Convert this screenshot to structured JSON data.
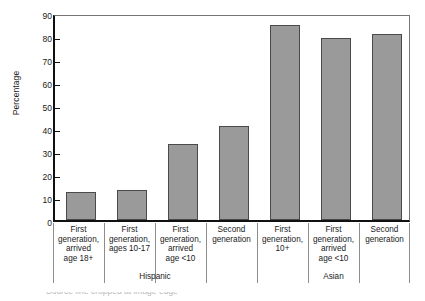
{
  "chart_data": {
    "type": "bar",
    "title": "",
    "xlabel": "",
    "ylabel": "Percentage",
    "ylim": [
      0,
      90
    ],
    "ytick_step": 10,
    "yticks": [
      0,
      10,
      20,
      30,
      40,
      50,
      60,
      70,
      80,
      90
    ],
    "grid": false,
    "legend": "none",
    "bar_color": "#9a9a9a",
    "bar_edge_color": "#4a4a4a",
    "categories": [
      "First generation, arrived age 18+",
      "First generation, ages 10-17",
      "First generation, arrived age <10",
      "Second generation",
      "First generation, 10+",
      "First generation, arrived age <10",
      "Second generation"
    ],
    "category_lines": [
      [
        "First",
        "generation,",
        "arrived",
        "age 18+"
      ],
      [
        "First",
        "generation,",
        "ages 10-17"
      ],
      [
        "First",
        "generation,",
        "arrived",
        "age <10"
      ],
      [
        "Second",
        "generation"
      ],
      [
        "First",
        "generation,",
        "10+"
      ],
      [
        "First",
        "generation,",
        "arrived",
        "age <10"
      ],
      [
        "Second",
        "generation"
      ]
    ],
    "values": [
      12,
      13,
      33,
      41,
      85,
      79,
      81
    ],
    "groups": [
      {
        "label": "Hispanic",
        "start": 0,
        "end": 3
      },
      {
        "label": "Asian",
        "start": 4,
        "end": 6
      }
    ]
  },
  "footer": {
    "cropped_caption": "Source line cropped at image edge"
  }
}
